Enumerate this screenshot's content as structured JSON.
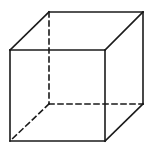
{
  "diagram": {
    "type": "wireframe-cube",
    "width": 156,
    "height": 147,
    "background": "#ffffff",
    "stroke_color": "#1a1a1a",
    "stroke_width": 1.6,
    "dash_pattern": "5,4",
    "vertices": {
      "front_top_left": [
        10,
        50
      ],
      "front_top_right": [
        105,
        50
      ],
      "front_bottom_right": [
        105,
        141
      ],
      "front_bottom_left": [
        10,
        141
      ],
      "back_top_left": [
        49,
        12
      ],
      "back_top_right": [
        143,
        12
      ],
      "back_bottom_right": [
        143,
        104
      ],
      "back_bottom_left": [
        49,
        104
      ]
    },
    "edges": [
      {
        "name": "front-top-edge",
        "from": "front_top_left",
        "to": "front_top_right",
        "hidden": false
      },
      {
        "name": "front-right-edge",
        "from": "front_top_right",
        "to": "front_bottom_right",
        "hidden": false
      },
      {
        "name": "front-bottom-edge",
        "from": "front_bottom_right",
        "to": "front_bottom_left",
        "hidden": false
      },
      {
        "name": "front-left-edge",
        "from": "front_bottom_left",
        "to": "front_top_left",
        "hidden": false
      },
      {
        "name": "back-top-edge",
        "from": "back_top_left",
        "to": "back_top_right",
        "hidden": false
      },
      {
        "name": "back-right-edge",
        "from": "back_top_right",
        "to": "back_bottom_right",
        "hidden": false
      },
      {
        "name": "top-left-diagonal-edge",
        "from": "front_top_left",
        "to": "back_top_left",
        "hidden": false
      },
      {
        "name": "top-right-diagonal-edge",
        "from": "front_top_right",
        "to": "back_top_right",
        "hidden": false
      },
      {
        "name": "bottom-right-diagonal-edge",
        "from": "front_bottom_right",
        "to": "back_bottom_right",
        "hidden": false
      },
      {
        "name": "back-left-edge",
        "from": "back_top_left",
        "to": "back_bottom_left",
        "hidden": true
      },
      {
        "name": "back-bottom-edge",
        "from": "back_bottom_left",
        "to": "back_bottom_right",
        "hidden": true
      },
      {
        "name": "bottom-left-diagonal-edge",
        "from": "back_bottom_left",
        "to": "front_bottom_left",
        "hidden": true
      }
    ]
  }
}
